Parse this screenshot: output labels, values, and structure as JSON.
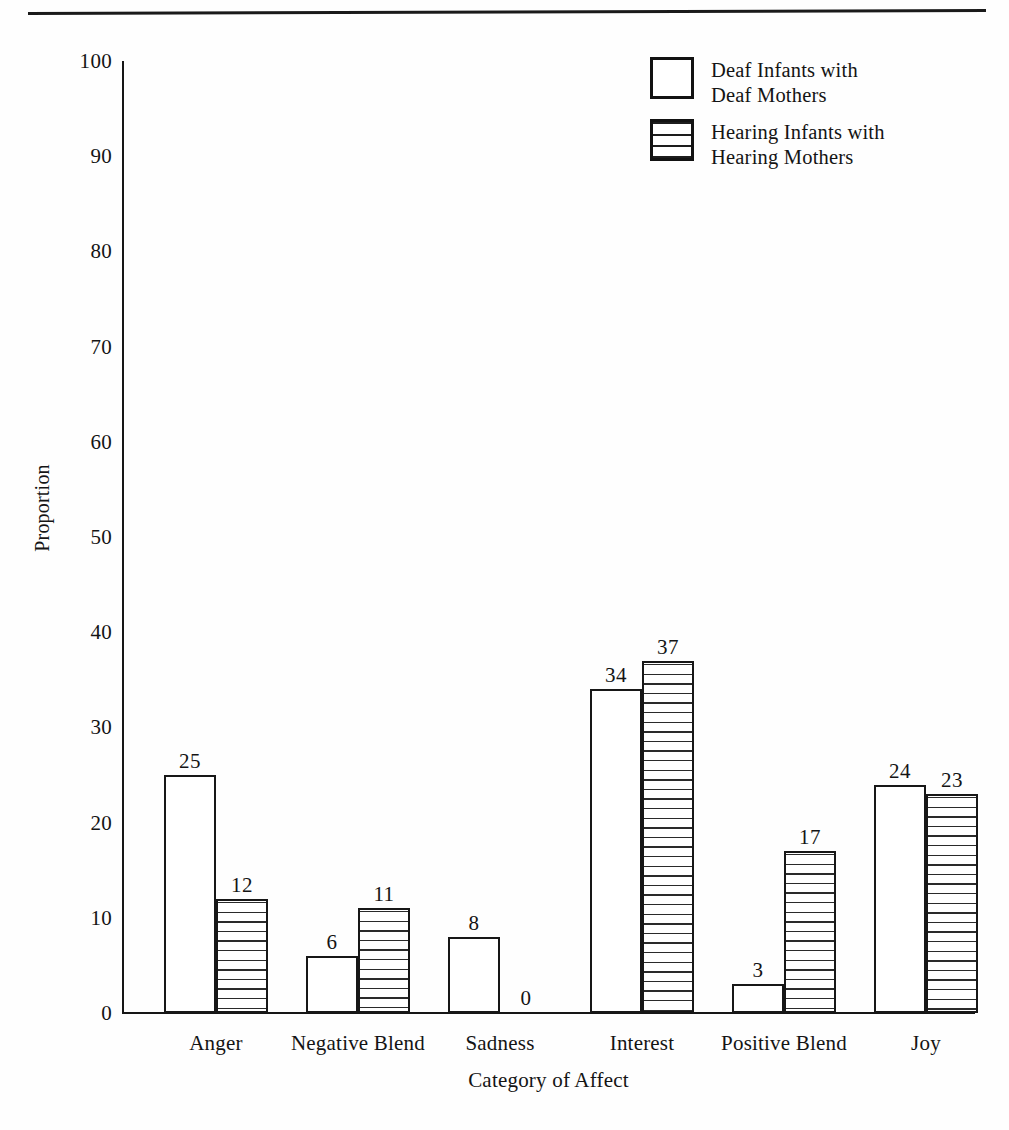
{
  "page": {
    "header_rule": "horizontal-rule",
    "background_color": "#ffffff",
    "ink_color": "#141414"
  },
  "legend": {
    "position": "top-right",
    "entries": [
      {
        "swatch": "white-open-box",
        "line1": "Deaf Infants with",
        "line2": "Deaf Mothers"
      },
      {
        "swatch": "horizontal-hatch-box",
        "line1": "Hearing Infants with",
        "line2": "Hearing Mothers"
      }
    ]
  },
  "axes": {
    "y_title": "Proportion",
    "x_title": "Category of Affect",
    "y_ticks": [
      "100",
      "90",
      "80",
      "70",
      "60",
      "50",
      "40",
      "30",
      "20",
      "10",
      "0"
    ]
  },
  "chart_data": {
    "type": "bar",
    "title": "",
    "subtitle": "",
    "xlabel": "Category of Affect",
    "ylabel": "Proportion",
    "ylim": [
      0,
      100
    ],
    "ytick_step": 10,
    "grid": false,
    "legend_position": "top-right",
    "bar_value_labels": true,
    "categories": [
      "Anger",
      "Negative Blend",
      "Sadness",
      "Interest",
      "Positive Blend",
      "Joy"
    ],
    "series": [
      {
        "name": "Deaf Infants with Deaf Mothers",
        "style": "white-open",
        "values": [
          25,
          6,
          8,
          34,
          3,
          24
        ]
      },
      {
        "name": "Hearing Infants with Hearing Mothers",
        "style": "horizontal-hatch",
        "values": [
          12,
          11,
          0,
          37,
          17,
          23
        ]
      }
    ]
  }
}
